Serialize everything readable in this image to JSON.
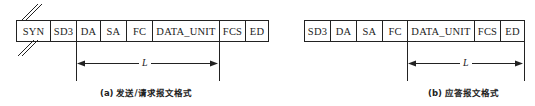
{
  "diagrams": [
    {
      "id": "a",
      "caption": "(a) 发送/请求报文格式",
      "fields": [
        "SYN",
        "SD3",
        "DA",
        "SA",
        "FC",
        "DATA_UNIT",
        "FCS",
        "ED"
      ],
      "length_label": "L",
      "length_span": {
        "from": "DA",
        "to": "FCS (start)"
      },
      "break_marks": "double-slash on SYN field"
    },
    {
      "id": "b",
      "caption": "(b) 应答报文格式",
      "fields": [
        "SD3",
        "DA",
        "SA",
        "FC",
        "DATA_UNIT",
        "FCS",
        "ED"
      ],
      "length_label": "L",
      "length_span": {
        "from": "DATA_UNIT",
        "to": "ED (end)"
      }
    }
  ],
  "colors": {
    "line": "#222222",
    "background": "#ffffff"
  }
}
